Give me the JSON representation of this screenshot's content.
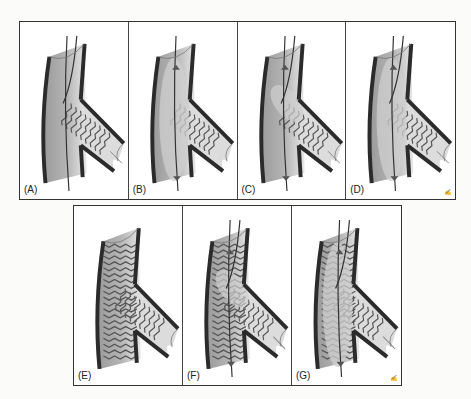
{
  "figure": {
    "top_row": [
      {
        "id": "A",
        "label": "(A)",
        "main_stent": false,
        "branch_stent": true,
        "wires": 2,
        "balloon": "none",
        "markers": false,
        "signature": ""
      },
      {
        "id": "B",
        "label": "(B)",
        "main_stent": false,
        "branch_stent": true,
        "wires": 1,
        "balloon": "main",
        "markers": true,
        "signature": ""
      },
      {
        "id": "C",
        "label": "(C)",
        "main_stent": false,
        "branch_stent": true,
        "wires": 2,
        "balloon": "kiss",
        "markers": true,
        "signature": ""
      },
      {
        "id": "D",
        "label": "(D)",
        "main_stent": false,
        "branch_stent": true,
        "wires": 2,
        "balloon": "main-long",
        "markers": true,
        "signature": "signature-mark"
      }
    ],
    "bottom_row": [
      {
        "id": "E",
        "label": "(E)",
        "main_stent": true,
        "branch_stent": true,
        "wires": 0,
        "balloon": "none",
        "markers": false,
        "signature": ""
      },
      {
        "id": "F",
        "label": "(F)",
        "main_stent": true,
        "branch_stent": true,
        "wires": 2,
        "balloon": "kiss",
        "markers": true,
        "signature": ""
      },
      {
        "id": "G",
        "label": "(G)",
        "main_stent": true,
        "branch_stent": true,
        "wires": 2,
        "balloon": "main-long",
        "markers": true,
        "signature": "signature-mark"
      }
    ],
    "colors": {
      "vessel_wall": "#2b2b2b",
      "vessel_fill": "#b5b5b5",
      "vessel_highlight": "#e8e8e8",
      "stent_strut": "#555555",
      "wire": "#333333",
      "balloon": "#cfcfcf"
    }
  }
}
